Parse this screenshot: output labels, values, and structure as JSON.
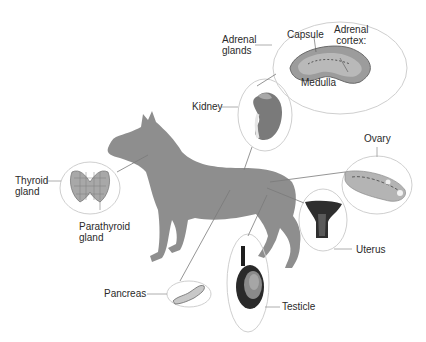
{
  "diagram": {
    "colors": {
      "background": "#ffffff",
      "silhouette": "#8e8e8e",
      "callout_circle": "#cfcfcf",
      "leader_line": "#7a7a7a",
      "text": "#2a2a2a"
    },
    "labels": {
      "adrenal_glands": "Adrenal\nglands",
      "capsule": "Capsule",
      "adrenal_cortex": "Adrenal\ncortex:",
      "medulla": "Medulla",
      "kidney": "Kidney",
      "ovary": "Ovary",
      "thyroid_gland": "Thyroid\ngland",
      "parathyroid_gland": "Parathyroid\ngland",
      "uterus": "Uterus",
      "pancreas": "Pancreas",
      "testicle": "Testicle"
    }
  }
}
